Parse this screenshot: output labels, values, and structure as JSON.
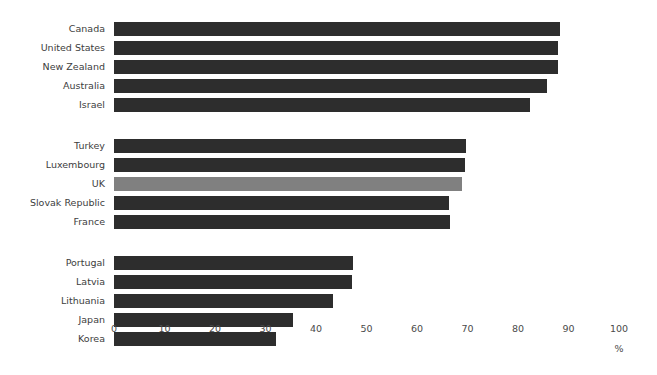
{
  "chart_data": {
    "type": "bar",
    "orientation": "horizontal",
    "title": "",
    "subtitle": "",
    "xlabel": "%",
    "ylabel": "",
    "xlim": [
      0,
      100
    ],
    "xticks": [
      "0",
      "10",
      "20",
      "30",
      "40",
      "50",
      "60",
      "70",
      "80",
      "90",
      "100"
    ],
    "grid": false,
    "legend": false,
    "legend_position": "none",
    "bar_color": "#2d2d2d",
    "highlight_color": "#808080",
    "highlighted_category": "UK",
    "groups": [
      {
        "categories": [
          "Canada",
          "United States",
          "New Zealand",
          "Australia",
          "Israel"
        ],
        "values": [
          88.3,
          88.0,
          88.0,
          85.7,
          82.4
        ]
      },
      {
        "categories": [
          "Turkey",
          "Luxembourg",
          "UK",
          "Slovak Republic",
          "France"
        ],
        "values": [
          69.7,
          69.5,
          69.0,
          66.3,
          66.6
        ]
      },
      {
        "categories": [
          "Portugal",
          "Latvia",
          "Lithuania",
          "Japan",
          "Korea"
        ],
        "values": [
          47.3,
          47.1,
          43.3,
          35.4,
          32.1
        ]
      }
    ],
    "categories": [
      "Canada",
      "United States",
      "New Zealand",
      "Australia",
      "Israel",
      "Turkey",
      "Luxembourg",
      "UK",
      "Slovak Republic",
      "France",
      "Portugal",
      "Latvia",
      "Lithuania",
      "Japan",
      "Korea"
    ],
    "values": [
      88.3,
      88.0,
      88.0,
      85.7,
      82.4,
      69.7,
      69.5,
      69.0,
      66.3,
      66.6,
      47.3,
      47.1,
      43.3,
      35.4,
      32.1
    ]
  }
}
